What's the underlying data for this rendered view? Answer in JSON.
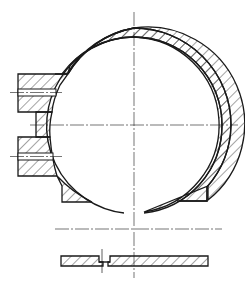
{
  "drawing": {
    "title": "Ring clamp sectional view",
    "colors": {
      "line": "#1a1a1a",
      "background": "#ffffff"
    },
    "views": [
      {
        "name": "front-section",
        "description": "Split ring housing with two bolted lugs on left"
      },
      {
        "name": "bottom-section",
        "description": "Strip section with joint notch"
      }
    ]
  }
}
